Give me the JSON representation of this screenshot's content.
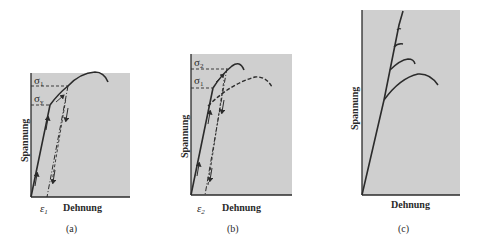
{
  "colors": {
    "panel_fill": "#cfcfcf",
    "line": "#2b2b2b",
    "background": "#ffffff"
  },
  "panels": [
    {
      "id": "a",
      "caption": "(a)",
      "ylabel": "Spannung",
      "xlabel": "Dehnung",
      "strain_label": "ε",
      "strain_sub": "1",
      "stress_labels": [
        {
          "sym": "σ",
          "sub": "1"
        },
        {
          "sym": "σ",
          "sub": "y"
        }
      ]
    },
    {
      "id": "b",
      "caption": "(b)",
      "ylabel": "Spannung",
      "xlabel": "Dehnung",
      "strain_label": "ε",
      "strain_sub": "2",
      "stress_labels": [
        {
          "sym": "σ",
          "sub": "2"
        },
        {
          "sym": "σ",
          "sub": "1"
        }
      ]
    },
    {
      "id": "c",
      "caption": "(c)",
      "ylabel": "Spannung",
      "xlabel": "Dehnung"
    }
  ]
}
